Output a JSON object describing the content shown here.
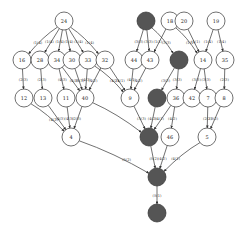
{
  "diagram": {
    "type": "directed-graph",
    "node_radius": 9,
    "colors": {
      "light_fill": "#ffffff",
      "dark_fill": "#555555",
      "stroke": "#333333"
    },
    "nodes": [
      {
        "id": "n24",
        "label": "24",
        "x": 64,
        "y": 21,
        "dark": false
      },
      {
        "id": "d1",
        "label": "",
        "x": 146,
        "y": 21,
        "dark": true
      },
      {
        "id": "n18",
        "label": "18",
        "x": 170,
        "y": 21,
        "dark": false
      },
      {
        "id": "n20",
        "label": "20",
        "x": 184,
        "y": 21,
        "dark": false
      },
      {
        "id": "n19",
        "label": "19",
        "x": 216,
        "y": 21,
        "dark": false
      },
      {
        "id": "n16",
        "label": "16",
        "x": 22,
        "y": 60,
        "dark": false
      },
      {
        "id": "n28",
        "label": "28",
        "x": 40,
        "y": 60,
        "dark": false
      },
      {
        "id": "n34",
        "label": "34",
        "x": 57,
        "y": 60,
        "dark": false
      },
      {
        "id": "n30",
        "label": "30",
        "x": 72,
        "y": 60,
        "dark": false
      },
      {
        "id": "n33",
        "label": "33",
        "x": 88,
        "y": 60,
        "dark": false
      },
      {
        "id": "n32",
        "label": "32",
        "x": 105,
        "y": 60,
        "dark": false
      },
      {
        "id": "n44",
        "label": "44",
        "x": 134,
        "y": 60,
        "dark": false
      },
      {
        "id": "n43",
        "label": "43",
        "x": 150,
        "y": 60,
        "dark": false
      },
      {
        "id": "d2",
        "label": "",
        "x": 179,
        "y": 60,
        "dark": true
      },
      {
        "id": "n14",
        "label": "14",
        "x": 203,
        "y": 60,
        "dark": false
      },
      {
        "id": "n35",
        "label": "35",
        "x": 225,
        "y": 60,
        "dark": false
      },
      {
        "id": "n12",
        "label": "12",
        "x": 24,
        "y": 98,
        "dark": false
      },
      {
        "id": "n13",
        "label": "13",
        "x": 43,
        "y": 98,
        "dark": false
      },
      {
        "id": "n11",
        "label": "11",
        "x": 66,
        "y": 98,
        "dark": false
      },
      {
        "id": "n40",
        "label": "40",
        "x": 85,
        "y": 98,
        "dark": false
      },
      {
        "id": "n9",
        "label": "9",
        "x": 130,
        "y": 98,
        "dark": false
      },
      {
        "id": "d3",
        "label": "",
        "x": 157,
        "y": 98,
        "dark": true
      },
      {
        "id": "n36",
        "label": "36",
        "x": 176,
        "y": 98,
        "dark": false
      },
      {
        "id": "n42",
        "label": "42",
        "x": 192,
        "y": 98,
        "dark": false
      },
      {
        "id": "n7",
        "label": "7",
        "x": 208,
        "y": 98,
        "dark": false
      },
      {
        "id": "n8",
        "label": "8",
        "x": 224,
        "y": 98,
        "dark": false
      },
      {
        "id": "n4",
        "label": "4",
        "x": 71,
        "y": 137,
        "dark": false
      },
      {
        "id": "d4",
        "label": "",
        "x": 149,
        "y": 137,
        "dark": true
      },
      {
        "id": "n46",
        "label": "46",
        "x": 170,
        "y": 137,
        "dark": false
      },
      {
        "id": "n5",
        "label": "5",
        "x": 207,
        "y": 137,
        "dark": false
      },
      {
        "id": "d5",
        "label": "",
        "x": 157,
        "y": 177,
        "dark": true
      },
      {
        "id": "d6",
        "label": "",
        "x": 157,
        "y": 213,
        "dark": true
      }
    ],
    "edges": [
      {
        "from": "n24",
        "to": "n16",
        "label": "(1(4)"
      },
      {
        "from": "n24",
        "to": "n28",
        "label": "(1(4)"
      },
      {
        "from": "n24",
        "to": "n34",
        "label": "(1(4)"
      },
      {
        "from": "n24",
        "to": "n30",
        "label": "(1(4)"
      },
      {
        "from": "n24",
        "to": "n33",
        "label": "(1(4)"
      },
      {
        "from": "n24",
        "to": "n32",
        "label": "(1(4)"
      },
      {
        "from": "d1",
        "to": "n44",
        "label": "(3(3)"
      },
      {
        "from": "d1",
        "to": "n43",
        "label": "(3(3)"
      },
      {
        "from": "d1",
        "to": "d2",
        "label": "(3(3)"
      },
      {
        "from": "n18",
        "to": "n43",
        "label": "(1(1)"
      },
      {
        "from": "n18",
        "to": "n14",
        "label": "(1(1)"
      },
      {
        "from": "n20",
        "to": "n14",
        "label": "(1(1)"
      },
      {
        "from": "n19",
        "to": "n14",
        "label": "(1(4)"
      },
      {
        "from": "n19",
        "to": "n35",
        "label": "(1(4)"
      },
      {
        "from": "n16",
        "to": "n12",
        "label": "(2(3)"
      },
      {
        "from": "n28",
        "to": "n13",
        "label": "(2(3)"
      },
      {
        "from": "n34",
        "to": "n11",
        "label": "(4(3)"
      },
      {
        "from": "n34",
        "to": "n40",
        "label": "(4(3)"
      },
      {
        "from": "n30",
        "to": "n40",
        "label": "(5(3)"
      },
      {
        "from": "n33",
        "to": "n40",
        "label": "(4(3)"
      },
      {
        "from": "n33",
        "to": "n9",
        "label": "(4(2)"
      },
      {
        "from": "n32",
        "to": "n9",
        "label": "(4(1)"
      },
      {
        "from": "n32",
        "to": "n40",
        "label": "(4(2)"
      },
      {
        "from": "n44",
        "to": "n9",
        "label": "(4(1)"
      },
      {
        "from": "n43",
        "to": "n9",
        "label": "(4(2)"
      },
      {
        "from": "d2",
        "to": "d3",
        "label": "(3(3)"
      },
      {
        "from": "d2",
        "to": "n36",
        "label": "(3(3)"
      },
      {
        "from": "n14",
        "to": "n42",
        "label": "(3(3)"
      },
      {
        "from": "n14",
        "to": "n7",
        "label": "(3(3)"
      },
      {
        "from": "n35",
        "to": "n8",
        "label": "(2(3)"
      },
      {
        "from": "n12",
        "to": "n4",
        "label": "(4(2)"
      },
      {
        "from": "n13",
        "to": "n4",
        "label": "(4(3)"
      },
      {
        "from": "n11",
        "to": "n4",
        "label": "(4(3)"
      },
      {
        "from": "n40",
        "to": "n4",
        "label": "(2(3)"
      },
      {
        "from": "n40",
        "to": "d4",
        "label": ""
      },
      {
        "from": "n9",
        "to": "d4",
        "label": "(3(3)"
      },
      {
        "from": "d3",
        "to": "d4",
        "label": "(4(2)"
      },
      {
        "from": "n36",
        "to": "d4",
        "label": "(4(1)"
      },
      {
        "from": "n36",
        "to": "n46",
        "label": "(4(2)"
      },
      {
        "from": "n7",
        "to": "n5",
        "label": "(2(2)"
      },
      {
        "from": "n8",
        "to": "n5",
        "label": "(3(2)"
      },
      {
        "from": "n4",
        "to": "d5",
        "label": "(5(2)"
      },
      {
        "from": "d4",
        "to": "d5",
        "label": "(5(2)"
      },
      {
        "from": "n46",
        "to": "d5",
        "label": "(4(2)"
      },
      {
        "from": "n5",
        "to": "d5",
        "label": "(4(1)"
      },
      {
        "from": "d5",
        "to": "d6",
        "label": "(5(1)"
      }
    ]
  }
}
